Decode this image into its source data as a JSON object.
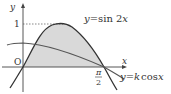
{
  "figure": {
    "axis_labels": {
      "x": "x",
      "y": "y",
      "origin": "O"
    },
    "tick_labels": {
      "y_one": "1",
      "x_pi_num": "π",
      "x_pi_den": "2"
    },
    "curves": [
      {
        "name": "sin2x",
        "label": "y = sin 2x"
      },
      {
        "name": "kcosx",
        "label": "y = k cos x"
      }
    ],
    "colors": {
      "line": "#333333",
      "shade": "#d9d9d9",
      "dashed": "#555555"
    }
  },
  "labels": {
    "sin_y": "y",
    "sin_eq": "=",
    "sin_fn": "sin 2",
    "sin_x": "x",
    "cos_y": "y",
    "cos_eq": "=",
    "cos_k": "k",
    "cos_fn": "cos",
    "cos_x": "x"
  }
}
